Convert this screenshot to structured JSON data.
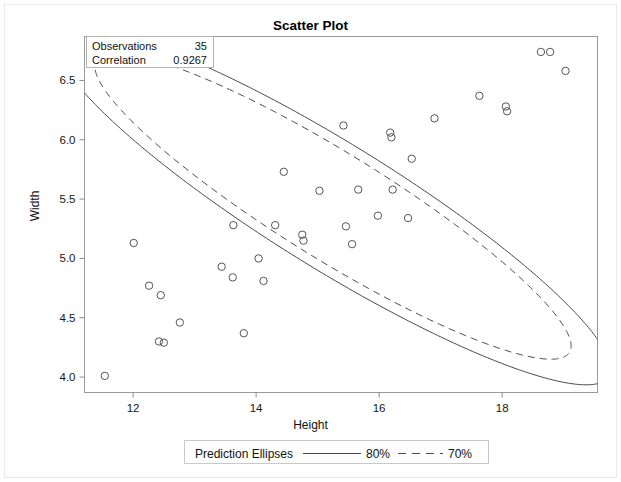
{
  "chart_data": {
    "type": "scatter",
    "title": "Scatter Plot",
    "xlabel": "Height",
    "ylabel": "Width",
    "xlim": [
      11.21,
      19.55
    ],
    "ylim": [
      3.87,
      6.87
    ],
    "xticks": [
      12,
      14,
      16,
      18
    ],
    "xtick_labels": [
      "12",
      "14",
      "16",
      "18"
    ],
    "yticks": [
      4.0,
      4.5,
      5.0,
      5.5,
      6.0,
      6.5
    ],
    "ytick_labels": [
      "4.0",
      "4.5",
      "5.0",
      "5.5",
      "6.0",
      "6.5"
    ],
    "grid": false,
    "marker": "open-circle",
    "marker_color": "#555555",
    "legend_position": "bottom-outside",
    "points": [
      {
        "x": 11.54,
        "y": 4.01
      },
      {
        "x": 12.01,
        "y": 5.13
      },
      {
        "x": 12.26,
        "y": 4.77
      },
      {
        "x": 12.45,
        "y": 4.69
      },
      {
        "x": 12.42,
        "y": 4.3
      },
      {
        "x": 12.5,
        "y": 4.29
      },
      {
        "x": 12.76,
        "y": 4.46
      },
      {
        "x": 13.44,
        "y": 4.93
      },
      {
        "x": 13.63,
        "y": 5.28
      },
      {
        "x": 13.62,
        "y": 4.84
      },
      {
        "x": 13.8,
        "y": 4.37
      },
      {
        "x": 14.04,
        "y": 5.0
      },
      {
        "x": 14.12,
        "y": 4.81
      },
      {
        "x": 14.31,
        "y": 5.28
      },
      {
        "x": 14.45,
        "y": 5.73
      },
      {
        "x": 14.75,
        "y": 5.2
      },
      {
        "x": 14.77,
        "y": 5.15
      },
      {
        "x": 15.03,
        "y": 5.57
      },
      {
        "x": 15.42,
        "y": 6.12
      },
      {
        "x": 15.46,
        "y": 5.27
      },
      {
        "x": 15.56,
        "y": 5.12
      },
      {
        "x": 15.66,
        "y": 5.58
      },
      {
        "x": 15.98,
        "y": 5.36
      },
      {
        "x": 16.18,
        "y": 6.06
      },
      {
        "x": 16.2,
        "y": 6.02
      },
      {
        "x": 16.22,
        "y": 5.58
      },
      {
        "x": 16.47,
        "y": 5.34
      },
      {
        "x": 16.53,
        "y": 5.84
      },
      {
        "x": 16.9,
        "y": 6.18
      },
      {
        "x": 17.63,
        "y": 6.37
      },
      {
        "x": 18.06,
        "y": 6.28
      },
      {
        "x": 18.08,
        "y": 6.24
      },
      {
        "x": 18.63,
        "y": 6.74
      },
      {
        "x": 18.78,
        "y": 6.74
      },
      {
        "x": 19.03,
        "y": 6.58
      }
    ],
    "ellipses": [
      {
        "name": "80% prediction ellipse",
        "level": "80%",
        "style": "solid",
        "center_x": 15.25,
        "center_y": 5.44,
        "semi_major": 4.72,
        "semi_minor": 0.59,
        "angle_deg": -17.2
      },
      {
        "name": "70% prediction ellipse",
        "level": "70%",
        "style": "dashed",
        "center_x": 15.25,
        "center_y": 5.44,
        "semi_major": 4.05,
        "semi_minor": 0.5,
        "angle_deg": -17.2
      }
    ]
  },
  "stats_box": {
    "rows": [
      {
        "key": "Observations",
        "value": "35"
      },
      {
        "key": "Correlation",
        "value": "0.9267"
      }
    ]
  },
  "legend": {
    "title": "Prediction Ellipses",
    "entries": [
      {
        "label": "80%",
        "style": "solid"
      },
      {
        "label": "70%",
        "style": "dashed"
      }
    ]
  },
  "colors": {
    "axis": "#8a8a8a",
    "text": "#111111",
    "marker": "#555555",
    "ellipse": "#4a4a4a",
    "frame": "#9b9b9b"
  }
}
